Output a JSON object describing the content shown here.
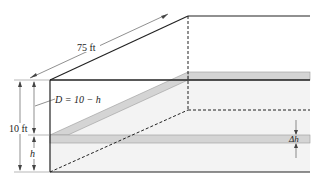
{
  "diagram": {
    "type": "pool-cross-section",
    "labels": {
      "length": "75 ft",
      "depth": "10 ft",
      "D": "D = 10 − h",
      "h": "h",
      "dh": "Δh"
    },
    "colors": {
      "line": "#222222",
      "band_fill": "#d4d4d4",
      "band_stroke": "#9a9a9a",
      "water_fill": "#f2f2f2",
      "guide": "#888888"
    }
  }
}
